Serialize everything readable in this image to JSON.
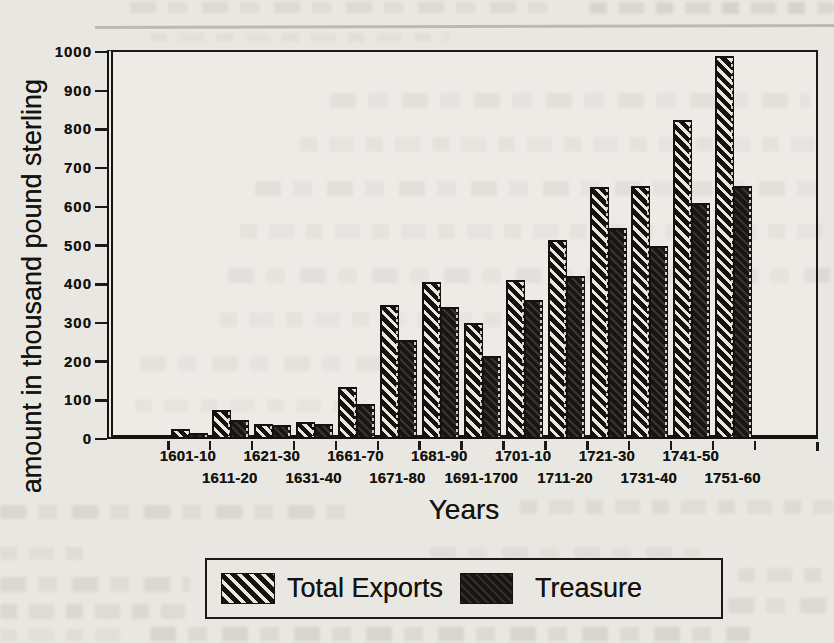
{
  "chart_data": {
    "type": "bar",
    "title": "",
    "categories": [
      "1601-10",
      "1611-20",
      "1621-30",
      "1631-40",
      "1661-70",
      "1671-80",
      "1681-90",
      "1691-1700",
      "1701-10",
      "1711-20",
      "1721-30",
      "1731-40",
      "1741-50",
      "1751-60"
    ],
    "series": [
      {
        "name": "Total Exports",
        "pattern": "diagonal-hatch",
        "values": [
          25,
          75,
          40,
          45,
          135,
          345,
          405,
          300,
          410,
          515,
          650,
          655,
          825,
          990
        ]
      },
      {
        "name": "Treasure",
        "pattern": "solid-dark",
        "values": [
          15,
          50,
          35,
          40,
          90,
          255,
          340,
          215,
          360,
          420,
          545,
          500,
          610,
          655
        ]
      }
    ],
    "xlabel": "Years",
    "ylabel": "amount in thousand pound sterling",
    "ylim": [
      0,
      1000
    ],
    "yticks": [
      0,
      100,
      200,
      300,
      400,
      500,
      600,
      700,
      800,
      900,
      1000
    ],
    "x_tick_label_layout": "staggered-two-rows",
    "grid": false,
    "legend_position": "bottom",
    "unit": "thousand pound sterling",
    "colors": {
      "ink": "#1b1a16",
      "paper": "#e9e7e1",
      "hatch_light": "#e9e7df",
      "bar_dark": "#171612"
    }
  }
}
